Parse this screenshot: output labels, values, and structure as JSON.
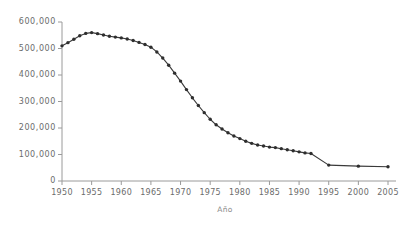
{
  "chart_data": {
    "type": "line",
    "title": "",
    "subtitle": "",
    "xlabel": "Año",
    "ylabel": "",
    "xlim": [
      1950,
      2005
    ],
    "ylim": [
      0,
      600000
    ],
    "grid": false,
    "legend": null,
    "legend_position": "none",
    "marker": "filled-circle",
    "line_color": "#3a3a3a",
    "marker_color": "#2e2e2e",
    "axis_color": "#9a9a9a",
    "tick_label_color": "#6b6b6b",
    "background_color": "#ffffff",
    "x_tick_labels": [
      "1950",
      "1955",
      "1960",
      "1965",
      "1970",
      "1975",
      "1980",
      "1985",
      "1990",
      "1995",
      "2000",
      "2005"
    ],
    "x_ticks": [
      1950,
      1955,
      1960,
      1965,
      1970,
      1975,
      1980,
      1985,
      1990,
      1995,
      2000,
      2005
    ],
    "y_tick_labels": [
      "0",
      "100,000",
      "200,000",
      "300,000",
      "400,000",
      "500,000",
      "600,000"
    ],
    "y_ticks": [
      0,
      100000,
      200000,
      300000,
      400000,
      500000,
      600000
    ],
    "x": [
      1950,
      1951,
      1952,
      1953,
      1954,
      1955,
      1956,
      1957,
      1958,
      1959,
      1960,
      1961,
      1962,
      1963,
      1964,
      1965,
      1966,
      1967,
      1968,
      1969,
      1970,
      1971,
      1972,
      1973,
      1974,
      1975,
      1976,
      1977,
      1978,
      1979,
      1980,
      1981,
      1982,
      1983,
      1984,
      1985,
      1986,
      1987,
      1988,
      1989,
      1990,
      1991,
      1992,
      1995,
      2000,
      2005
    ],
    "values": [
      510000,
      522000,
      535000,
      548000,
      557000,
      560000,
      556000,
      551000,
      546000,
      543000,
      540000,
      536000,
      530000,
      523000,
      515000,
      505000,
      487000,
      464000,
      437000,
      407000,
      377000,
      345000,
      314000,
      285000,
      258000,
      233000,
      212000,
      196000,
      182000,
      170000,
      160000,
      150000,
      142000,
      136000,
      132000,
      128000,
      126000,
      122000,
      118000,
      114000,
      110000,
      106000,
      104000,
      60000,
      56000,
      54000
    ],
    "series": [
      {
        "name": "serie-principal",
        "values": [
          510000,
          522000,
          535000,
          548000,
          557000,
          560000,
          556000,
          551000,
          546000,
          543000,
          540000,
          536000,
          530000,
          523000,
          515000,
          505000,
          487000,
          464000,
          437000,
          407000,
          377000,
          345000,
          314000,
          285000,
          258000,
          233000,
          212000,
          196000,
          182000,
          170000,
          160000,
          150000,
          142000,
          136000,
          132000,
          128000,
          126000,
          122000,
          118000,
          114000,
          110000,
          106000,
          104000,
          60000,
          56000,
          54000
        ]
      }
    ]
  }
}
